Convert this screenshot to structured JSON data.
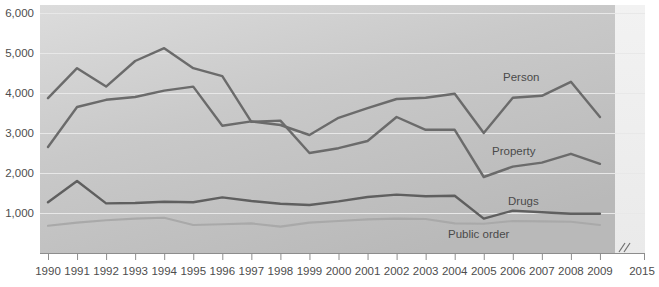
{
  "chart_data": {
    "type": "line",
    "title": "",
    "subtitle": "",
    "xlabel": "",
    "ylabel": "",
    "ylim": [
      0,
      6000
    ],
    "grid": true,
    "legend_position": "inline-right",
    "y_ticks": [
      "1,000",
      "2,000",
      "3,000",
      "4,000",
      "5,000",
      "6,000"
    ],
    "y_tick_values": [
      1000,
      2000,
      3000,
      4000,
      5000,
      6000
    ],
    "categories": [
      "1990",
      "1991",
      "1992",
      "1993",
      "1994",
      "1995",
      "1996",
      "1997",
      "1998",
      "1999",
      "2000",
      "2001",
      "2002",
      "2003",
      "2004",
      "2005",
      "2006",
      "2007",
      "2008",
      "2009"
    ],
    "x_axis_extra_tick": "2015",
    "x_axis_break": true,
    "series": [
      {
        "name": "Person",
        "label": "Person",
        "color": "#6b6b6b",
        "values": [
          2650,
          3650,
          3830,
          3900,
          4060,
          4160,
          3180,
          3290,
          3200,
          2950,
          3380,
          3620,
          3850,
          3880,
          3980,
          3000,
          3880,
          3930,
          4280,
          3400
        ]
      },
      {
        "name": "Property",
        "label": "Property",
        "color": "#6b6b6b",
        "values": [
          3870,
          4620,
          4160,
          4800,
          5120,
          4620,
          4420,
          3280,
          3310,
          2500,
          2620,
          2800,
          3400,
          3080,
          3080,
          1900,
          2160,
          2260,
          2480,
          2230
        ]
      },
      {
        "name": "Drugs",
        "label": "Drugs",
        "color": "#5f5f5f",
        "values": [
          1270,
          1800,
          1240,
          1250,
          1280,
          1270,
          1390,
          1300,
          1230,
          1200,
          1290,
          1400,
          1460,
          1420,
          1430,
          860,
          1060,
          1020,
          980,
          980
        ]
      },
      {
        "name": "Public order",
        "label": "Public order",
        "color": "#a9a9a9",
        "values": [
          680,
          760,
          820,
          860,
          880,
          700,
          720,
          740,
          660,
          760,
          800,
          840,
          860,
          850,
          740,
          730,
          800,
          790,
          780,
          700
        ]
      }
    ]
  }
}
